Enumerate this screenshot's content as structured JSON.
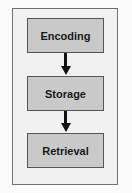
{
  "diagram": {
    "type": "flowchart",
    "direction": "top-to-bottom",
    "nodes": [
      {
        "id": "encoding",
        "label": "Encoding"
      },
      {
        "id": "storage",
        "label": "Storage"
      },
      {
        "id": "retrieval",
        "label": "Retrieval"
      }
    ],
    "edges": [
      {
        "from": "encoding",
        "to": "storage"
      },
      {
        "from": "storage",
        "to": "retrieval"
      }
    ],
    "colors": {
      "box_fill": "#c9c9c9",
      "box_border": "#555555",
      "frame_fill": "#f1f1f1",
      "arrow": "#111111"
    }
  }
}
